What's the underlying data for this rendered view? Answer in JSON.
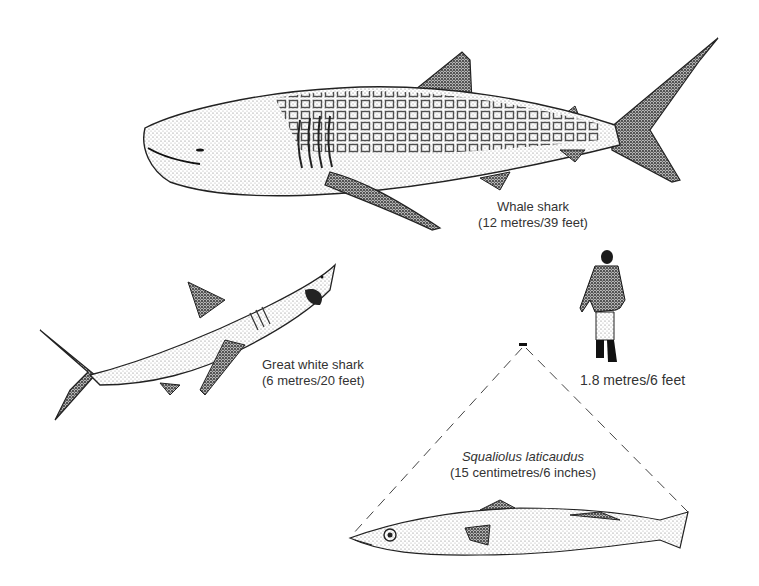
{
  "figure": {
    "subjects": [
      {
        "id": "whale-shark",
        "name": "Whale shark",
        "size": "(12 metres/39 feet)"
      },
      {
        "id": "great-white-shark",
        "name": "Great white shark",
        "size": "(6 metres/20 feet)"
      },
      {
        "id": "human",
        "name": "",
        "size": "1.8 metres/6 feet"
      },
      {
        "id": "squaliolus",
        "name": "Squaliolus laticaudus",
        "size": "(15 centimetres/6 inches)"
      }
    ],
    "colors": {
      "ink": "#1a1a1a",
      "stipple": "#555555",
      "background": "#ffffff",
      "text": "#333333"
    }
  }
}
